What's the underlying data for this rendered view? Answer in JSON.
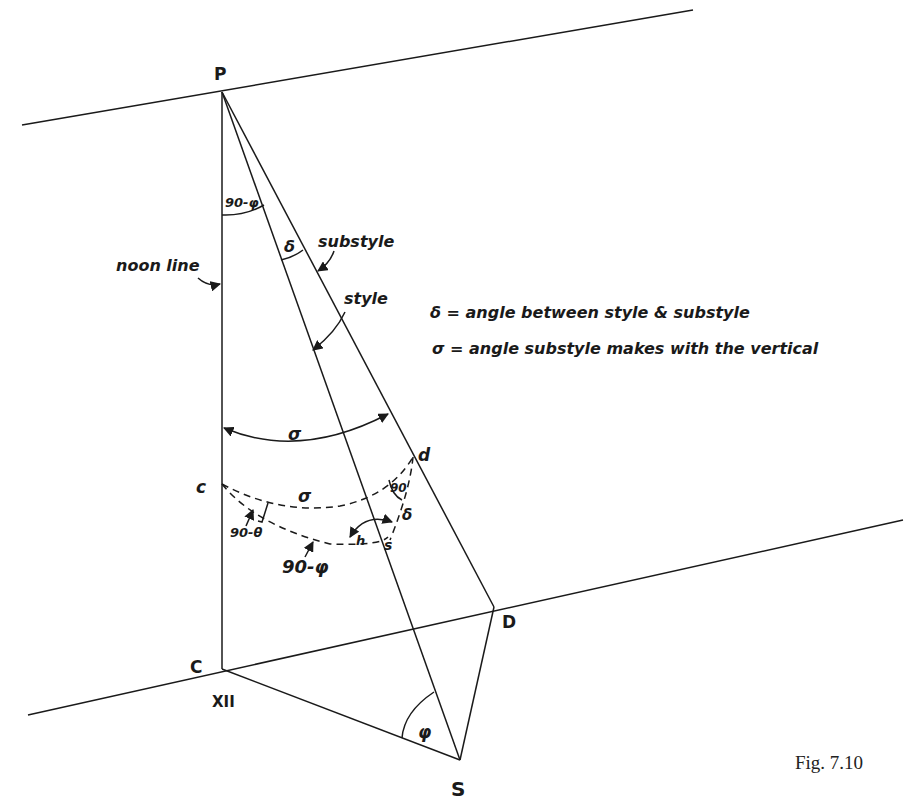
{
  "points": {
    "P": "P",
    "C": "C",
    "XII": "XII",
    "D": "D",
    "S": "S",
    "c": "c",
    "d": "d",
    "s": "s"
  },
  "labels": {
    "noon_line": "noon line",
    "substyle": "substyle",
    "style": "style",
    "angle_90_minus_phi_top": "90-φ",
    "delta_top": "δ",
    "sigma_big": "σ",
    "sigma_small": "σ",
    "right_angle": "90",
    "delta_small": "δ",
    "h": "h",
    "angle_90_minus_theta": "90-θ",
    "angle_90_minus_phi_bottom": "90-φ",
    "phi": "φ"
  },
  "legend": {
    "delta_def": "δ = angle between style & substyle",
    "sigma_def": "σ = angle substyle makes with the vertical"
  },
  "caption": "Fig. 7.10"
}
